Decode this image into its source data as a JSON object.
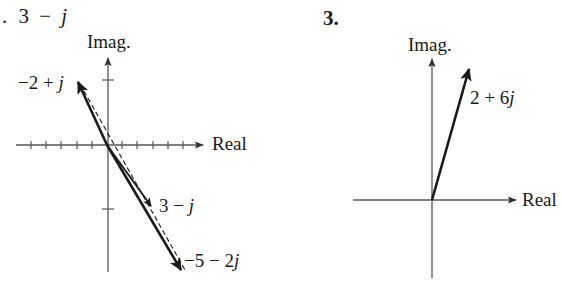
{
  "left_panel": {
    "header": {
      "bullet": ".",
      "expr_num": "3",
      "op": "−",
      "var": "j"
    },
    "imag_label": "Imag.",
    "real_label": "Real",
    "vectors": [
      {
        "name": "a",
        "label_pre": "−2 + ",
        "label_var": "j",
        "re": -2,
        "im": 1,
        "style": "solid-heavy"
      },
      {
        "name": "b",
        "label_pre": "3 − ",
        "label_var": "j",
        "re": 3,
        "im": -1,
        "style": "solid"
      },
      {
        "name": "result",
        "label_pre": "−5 − 2",
        "label_var": "j",
        "re": 5,
        "im": -2,
        "style": "solid-heavy"
      }
    ],
    "dashed_line": {
      "from": [
        -2,
        1
      ],
      "to": [
        5,
        -2
      ]
    },
    "real_ticks": [
      -5,
      -4,
      -3,
      -2,
      -1,
      1,
      2,
      3,
      4,
      5
    ],
    "imag_ticks": [
      1,
      -1
    ]
  },
  "right_panel": {
    "header": "3.",
    "imag_label": "Imag.",
    "real_label": "Real",
    "vectors": [
      {
        "name": "z",
        "label_pre": "2 + 6",
        "label_var": "j",
        "re": 2,
        "im": 6,
        "style": "solid-heavy"
      }
    ]
  },
  "colors": {
    "ink": "#1a1a1a",
    "axis": "#555555",
    "background": "#ffffff"
  }
}
